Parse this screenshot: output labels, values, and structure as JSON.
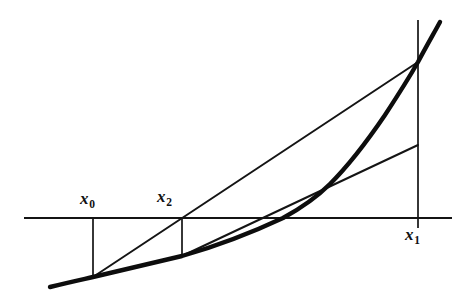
{
  "figure": {
    "background_color": "#ffffff",
    "ink_color": "#141414"
  },
  "labels": {
    "x0": {
      "base": "x",
      "sub": "0"
    },
    "x2": {
      "base": "x",
      "sub": "2"
    },
    "x1": {
      "base": "x",
      "sub": "1"
    }
  },
  "chart_data": {
    "type": "line",
    "title": "",
    "xlabel": "",
    "ylabel": "",
    "grid": false,
    "legend": false,
    "axis": {
      "horizontal_line_y": 218,
      "x_start": 24,
      "x_end": 452
    },
    "points": {
      "x0": {
        "x_axis": 93,
        "y_axis": 218,
        "x_curve": 93,
        "y_curve": 277
      },
      "x2": {
        "x_axis": 182,
        "y_axis": 218,
        "x_curve": 182,
        "y_curve": 256
      },
      "x1": {
        "x_axis": 418,
        "y_axis": 218,
        "x_curve": 418,
        "y_curve": 62
      },
      "root": {
        "x": 283,
        "y": 218
      }
    },
    "series": [
      {
        "name": "function-curve",
        "style": "thick",
        "points": [
          [
            50,
            287
          ],
          [
            70,
            282
          ],
          [
            93,
            277
          ],
          [
            130,
            268
          ],
          [
            160,
            261
          ],
          [
            182,
            256
          ],
          [
            215,
            246
          ],
          [
            250,
            233
          ],
          [
            283,
            218
          ],
          [
            310,
            201
          ],
          [
            330,
            184
          ],
          [
            355,
            160
          ],
          [
            380,
            126
          ],
          [
            400,
            95
          ],
          [
            418,
            62
          ],
          [
            430,
            40
          ],
          [
            440,
            22
          ]
        ]
      },
      {
        "name": "secant-1",
        "style": "thin",
        "from": [
          93,
          277
        ],
        "to": [
          418,
          62
        ],
        "crosses_axis_at_x": 182
      },
      {
        "name": "secant-2",
        "style": "thin",
        "from": [
          182,
          256
        ],
        "to": [
          418,
          145
        ]
      }
    ],
    "verticals": [
      {
        "name": "ordinate-x0",
        "x": 93,
        "y_top": 218,
        "y_bottom": 278
      },
      {
        "name": "ordinate-x2",
        "x": 182,
        "y_top": 218,
        "y_bottom": 257
      },
      {
        "name": "ordinate-x1",
        "x": 418,
        "y_top": 20,
        "y_bottom": 228
      }
    ]
  }
}
